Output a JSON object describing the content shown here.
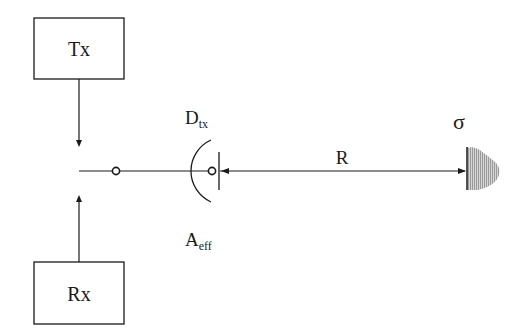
{
  "diagram": {
    "type": "radar-link-block-diagram",
    "blocks": {
      "tx": {
        "label": "Tx"
      },
      "rx": {
        "label": "Rx"
      }
    },
    "antenna": {
      "directivity_label": {
        "main": "D",
        "sub": "tx"
      },
      "aperture_label": {
        "main": "A",
        "sub": "eff"
      }
    },
    "range_label": "R",
    "target": {
      "rcs_label": "σ"
    },
    "colors": {
      "stroke": "#1a1a1a",
      "target_fill": "#b8b8b8",
      "background": "#ffffff"
    }
  }
}
